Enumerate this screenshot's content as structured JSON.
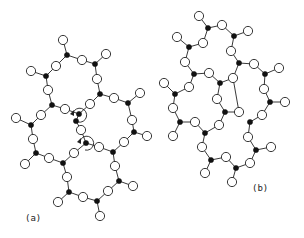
{
  "figure": {
    "panels": [
      {
        "id": "a",
        "label": "(a)",
        "description": "Fused ring network of tetrahedral units (black = network-forming atoms, white = bridging/terminal atoms) with rotation arrows at a shared vertex",
        "label_pos": [
          33,
          218
        ],
        "black": [
          [
            67,
            55
          ],
          [
            95,
            64
          ],
          [
            46,
            76
          ],
          [
            100,
            94
          ],
          [
            128,
            103
          ],
          [
            52,
            105
          ],
          [
            79,
            114
          ],
          [
            31,
            125
          ],
          [
            36,
            153
          ],
          [
            63,
            163
          ],
          [
            86,
            143
          ],
          [
            76,
            121
          ],
          [
            113,
            152
          ],
          [
            134,
            132
          ],
          [
            119,
            181
          ],
          [
            97,
            201
          ],
          [
            69,
            192
          ]
        ],
        "white": [
          [
            63,
            40
          ],
          [
            82,
            60
          ],
          [
            106,
            54
          ],
          [
            56,
            66
          ],
          [
            31,
            71
          ],
          [
            97,
            79
          ],
          [
            48,
            90
          ],
          [
            114,
            98
          ],
          [
            140,
            93
          ],
          [
            65,
            109
          ],
          [
            90,
            104
          ],
          [
            41,
            115
          ],
          [
            16,
            118
          ],
          [
            33,
            139
          ],
          [
            25,
            164
          ],
          [
            49,
            158
          ],
          [
            74,
            153
          ],
          [
            81,
            130
          ],
          [
            99,
            147
          ],
          [
            124,
            142
          ],
          [
            147,
            136
          ],
          [
            132,
            120
          ],
          [
            115,
            166
          ],
          [
            133,
            186
          ],
          [
            108,
            191
          ],
          [
            100,
            216
          ],
          [
            83,
            197
          ],
          [
            58,
            202
          ],
          [
            67,
            177
          ]
        ],
        "bonds": [
          [
            63,
            40,
            67,
            55
          ],
          [
            67,
            55,
            82,
            60
          ],
          [
            82,
            60,
            95,
            64
          ],
          [
            95,
            64,
            106,
            54
          ],
          [
            67,
            55,
            56,
            66
          ],
          [
            56,
            66,
            46,
            76
          ],
          [
            46,
            76,
            31,
            71
          ],
          [
            95,
            64,
            97,
            79
          ],
          [
            97,
            79,
            100,
            94
          ],
          [
            46,
            76,
            48,
            90
          ],
          [
            48,
            90,
            52,
            105
          ],
          [
            100,
            94,
            114,
            98
          ],
          [
            114,
            98,
            128,
            103
          ],
          [
            128,
            103,
            140,
            93
          ],
          [
            100,
            94,
            90,
            104
          ],
          [
            90,
            104,
            79,
            114
          ],
          [
            52,
            105,
            65,
            109
          ],
          [
            65,
            109,
            79,
            114
          ],
          [
            52,
            105,
            41,
            115
          ],
          [
            41,
            115,
            31,
            125
          ],
          [
            31,
            125,
            16,
            118
          ],
          [
            31,
            125,
            33,
            139
          ],
          [
            33,
            139,
            36,
            153
          ],
          [
            36,
            153,
            25,
            164
          ],
          [
            36,
            153,
            49,
            158
          ],
          [
            49,
            158,
            63,
            163
          ],
          [
            63,
            163,
            74,
            153
          ],
          [
            74,
            153,
            86,
            143
          ],
          [
            86,
            143,
            81,
            130
          ],
          [
            81,
            130,
            76,
            121
          ],
          [
            76,
            121,
            79,
            114
          ],
          [
            86,
            143,
            99,
            147
          ],
          [
            99,
            147,
            113,
            152
          ],
          [
            113,
            152,
            124,
            142
          ],
          [
            124,
            142,
            134,
            132
          ],
          [
            134,
            132,
            147,
            136
          ],
          [
            134,
            132,
            132,
            120
          ],
          [
            132,
            120,
            128,
            103
          ],
          [
            113,
            152,
            115,
            166
          ],
          [
            115,
            166,
            119,
            181
          ],
          [
            119,
            181,
            133,
            186
          ],
          [
            119,
            181,
            108,
            191
          ],
          [
            108,
            191,
            97,
            201
          ],
          [
            97,
            201,
            100,
            216
          ],
          [
            97,
            201,
            83,
            197
          ],
          [
            83,
            197,
            69,
            192
          ],
          [
            69,
            192,
            58,
            202
          ],
          [
            69,
            192,
            67,
            177
          ],
          [
            67,
            177,
            63,
            163
          ]
        ],
        "rotation_arrows": [
          {
            "cx": 80,
            "cy": 115,
            "r": 7
          },
          {
            "cx": 87,
            "cy": 143,
            "r": 7
          }
        ]
      },
      {
        "id": "b",
        "label": "(b)",
        "description": "Disordered (continuous random) network of the same units",
        "label_pos": [
          260,
          188
        ],
        "black": [
          [
            208,
            28
          ],
          [
            234,
            36
          ],
          [
            189,
            47
          ],
          [
            239,
            63
          ],
          [
            265,
            74
          ],
          [
            194,
            74
          ],
          [
            220,
            83
          ],
          [
            270,
            102
          ],
          [
            175,
            94
          ],
          [
            225,
            112
          ],
          [
            180,
            122
          ],
          [
            205,
            133
          ],
          [
            250,
            122
          ],
          [
            256,
            150
          ],
          [
            211,
            160
          ],
          [
            236,
            168
          ]
        ],
        "white": [
          [
            199,
            16
          ],
          [
            222,
            25
          ],
          [
            248,
            31
          ],
          [
            177,
            37
          ],
          [
            203,
            43
          ],
          [
            231,
            51
          ],
          [
            254,
            64
          ],
          [
            279,
            68
          ],
          [
            185,
            62
          ],
          [
            209,
            73
          ],
          [
            233,
            78
          ],
          [
            264,
            89
          ],
          [
            285,
            102
          ],
          [
            164,
            83
          ],
          [
            189,
            87
          ],
          [
            173,
            108
          ],
          [
            217,
            99
          ],
          [
            239,
            112
          ],
          [
            262,
            115
          ],
          [
            195,
            122
          ],
          [
            173,
            136
          ],
          [
            219,
            125
          ],
          [
            248,
            137
          ],
          [
            271,
            147
          ],
          [
            202,
            147
          ],
          [
            226,
            157
          ],
          [
            250,
            163
          ],
          [
            205,
            173
          ],
          [
            232,
            182
          ]
        ],
        "bonds": [
          [
            199,
            16,
            208,
            28
          ],
          [
            208,
            28,
            222,
            25
          ],
          [
            222,
            25,
            234,
            36
          ],
          [
            234,
            36,
            248,
            31
          ],
          [
            208,
            28,
            203,
            43
          ],
          [
            203,
            43,
            189,
            47
          ],
          [
            189,
            47,
            177,
            37
          ],
          [
            234,
            36,
            231,
            51
          ],
          [
            231,
            51,
            239,
            63
          ],
          [
            239,
            63,
            254,
            64
          ],
          [
            254,
            64,
            265,
            74
          ],
          [
            265,
            74,
            279,
            68
          ],
          [
            189,
            47,
            185,
            62
          ],
          [
            185,
            62,
            194,
            74
          ],
          [
            194,
            74,
            209,
            73
          ],
          [
            209,
            73,
            220,
            83
          ],
          [
            239,
            63,
            233,
            78
          ],
          [
            233,
            78,
            220,
            83
          ],
          [
            265,
            74,
            264,
            89
          ],
          [
            264,
            89,
            270,
            102
          ],
          [
            270,
            102,
            285,
            102
          ],
          [
            194,
            74,
            189,
            87
          ],
          [
            189,
            87,
            175,
            94
          ],
          [
            175,
            94,
            164,
            83
          ],
          [
            175,
            94,
            173,
            108
          ],
          [
            173,
            108,
            180,
            122
          ],
          [
            220,
            83,
            217,
            99
          ],
          [
            217,
            99,
            225,
            112
          ],
          [
            225,
            112,
            239,
            112
          ],
          [
            270,
            102,
            262,
            115
          ],
          [
            262,
            115,
            250,
            122
          ],
          [
            180,
            122,
            195,
            122
          ],
          [
            180,
            122,
            173,
            136
          ],
          [
            195,
            122,
            205,
            133
          ],
          [
            225,
            112,
            219,
            125
          ],
          [
            219,
            125,
            205,
            133
          ],
          [
            205,
            133,
            202,
            147
          ],
          [
            202,
            147,
            211,
            160
          ],
          [
            211,
            160,
            205,
            173
          ],
          [
            211,
            160,
            226,
            157
          ],
          [
            226,
            157,
            236,
            168
          ],
          [
            236,
            168,
            232,
            182
          ],
          [
            236,
            168,
            250,
            163
          ],
          [
            250,
            163,
            256,
            150
          ],
          [
            256,
            150,
            271,
            147
          ],
          [
            256,
            150,
            248,
            137
          ],
          [
            248,
            137,
            250,
            122
          ],
          [
            239,
            112,
            233,
            78
          ]
        ]
      }
    ]
  }
}
